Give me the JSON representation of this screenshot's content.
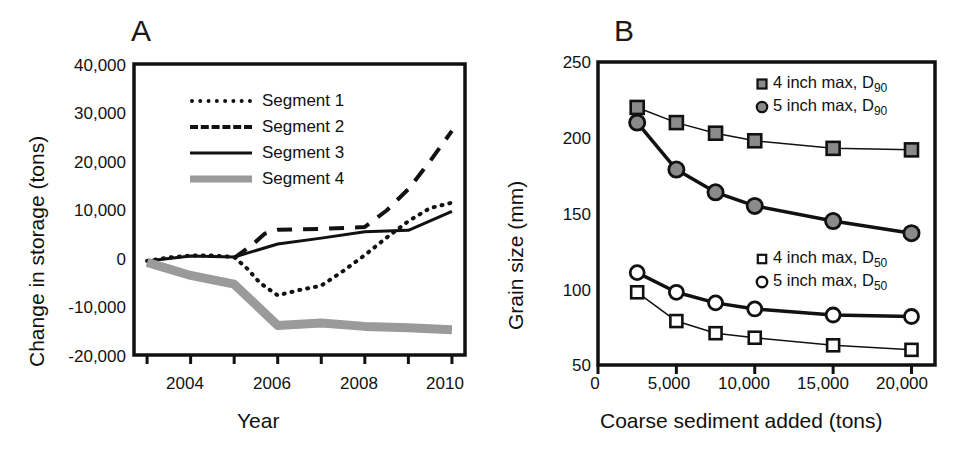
{
  "figure": {
    "background": "#ffffff",
    "width": 973,
    "height": 452
  },
  "panel_a": {
    "letter": "A",
    "chart_data": {
      "type": "line",
      "title": "",
      "xlabel": "Year",
      "ylabel": "Change in storage (tons)",
      "xlim": [
        2002.7,
        2010.3
      ],
      "ylim": [
        -20000,
        40000
      ],
      "xticks": [
        2003,
        2004,
        2005,
        2006,
        2007,
        2008,
        2009,
        2010
      ],
      "xticklabels": [
        "",
        "2004",
        "",
        "2006",
        "",
        "2008",
        "",
        "2010"
      ],
      "yticks": [
        -20000,
        -10000,
        0,
        10000,
        20000,
        30000,
        40000
      ],
      "yticklabels": [
        "-20,000",
        "-10,000",
        "0",
        "10,000",
        "20,000",
        "30,000",
        "40,000"
      ],
      "grid": false,
      "legend_position": "upper-left-inside",
      "series": [
        {
          "name": "Segment 1",
          "style": "dotted",
          "color": "#111111",
          "width": 4,
          "x": [
            2003,
            2003.5,
            2004,
            2004.5,
            2005,
            2005.3,
            2005.6,
            2006,
            2006.5,
            2007,
            2007.5,
            2008,
            2008.5,
            2009,
            2009.5,
            2010
          ],
          "y": [
            -600,
            100,
            500,
            500,
            200,
            -2200,
            -5200,
            -7700,
            -6600,
            -5700,
            -2700,
            600,
            4200,
            7600,
            10300,
            11400
          ]
        },
        {
          "name": "Segment 2",
          "style": "dashed",
          "color": "#111111",
          "width": 4,
          "x": [
            2005,
            2005.4,
            2005.7,
            2006,
            2007,
            2008,
            2008.5,
            2009,
            2009.5,
            2010
          ],
          "y": [
            0,
            2600,
            5000,
            5800,
            6000,
            6400,
            9800,
            14200,
            20000,
            26200
          ]
        },
        {
          "name": "Segment 3",
          "style": "solid",
          "color": "#111111",
          "width": 3,
          "x": [
            2003,
            2004,
            2005,
            2006,
            2007,
            2008,
            2009,
            2010
          ],
          "y": [
            -600,
            400,
            200,
            2900,
            4100,
            5400,
            5700,
            9600
          ]
        },
        {
          "name": "Segment 4",
          "style": "thick-gray",
          "color": "#9a9a9a",
          "width": 9,
          "x": [
            2003,
            2004,
            2005,
            2006,
            2007,
            2008,
            2009,
            2010
          ],
          "y": [
            -900,
            -3600,
            -5400,
            -13900,
            -13400,
            -14100,
            -14400,
            -14800
          ]
        }
      ]
    },
    "legend": [
      {
        "label": "Segment 1",
        "style": "dotted"
      },
      {
        "label": "Segment 2",
        "style": "dashed"
      },
      {
        "label": "Segment 3",
        "style": "solid"
      },
      {
        "label": "Segment 4",
        "style": "thick-gray"
      }
    ]
  },
  "panel_b": {
    "letter": "B",
    "chart_data": {
      "type": "line",
      "title": "",
      "xlabel": "Coarse sediment added (tons)",
      "ylabel": "Grain size (mm)",
      "xlim": [
        0,
        21500
      ],
      "ylim": [
        50,
        250
      ],
      "xticks": [
        0,
        5000,
        10000,
        15000,
        20000
      ],
      "xticklabels": [
        "0",
        "5,000",
        "10,000",
        "15,000",
        "20,000"
      ],
      "yticks": [
        50,
        100,
        150,
        200,
        250
      ],
      "yticklabels": [
        "50",
        "100",
        "150",
        "200",
        "250"
      ],
      "grid": false,
      "legend_position": "upper-right-inside and middle-right-inside",
      "x": [
        2500,
        5000,
        7500,
        10000,
        15000,
        20000
      ],
      "series": [
        {
          "name": "4 inch max, D90",
          "label_main": "4 inch max, D",
          "label_sub": "90",
          "marker": "filled-square",
          "marker_face": "#8a8a8a",
          "marker_edge": "#111111",
          "line_width": 1.5,
          "values": [
            220,
            210,
            203,
            198,
            193,
            192
          ]
        },
        {
          "name": "5 inch max, D90",
          "label_main": "5 inch max, D",
          "label_sub": "90",
          "marker": "filled-circle",
          "marker_face": "#8a8a8a",
          "marker_edge": "#111111",
          "line_width": 3.5,
          "values": [
            210,
            179,
            164,
            155,
            145,
            137
          ]
        },
        {
          "name": "4 inch max, D50",
          "label_main": "4 inch max, D",
          "label_sub": "50",
          "marker": "open-square",
          "marker_face": "#ffffff",
          "marker_edge": "#111111",
          "line_width": 1.5,
          "values": [
            98,
            79,
            71,
            68,
            63,
            60
          ]
        },
        {
          "name": "5 inch max, D50",
          "label_main": "5 inch max, D",
          "label_sub": "50",
          "marker": "open-circle",
          "marker_face": "#ffffff",
          "marker_edge": "#111111",
          "line_width": 3.5,
          "values": [
            111,
            98,
            91,
            87,
            83,
            82
          ]
        }
      ]
    },
    "legend_top": [
      {
        "label_main": "4 inch max, D",
        "label_sub": "90",
        "marker": "filled-square"
      },
      {
        "label_main": "5 inch max, D",
        "label_sub": "90",
        "marker": "filled-circle"
      }
    ],
    "legend_bottom": [
      {
        "label_main": "4 inch max, D",
        "label_sub": "50",
        "marker": "open-square"
      },
      {
        "label_main": "5 inch max, D",
        "label_sub": "50",
        "marker": "open-circle"
      }
    ]
  }
}
